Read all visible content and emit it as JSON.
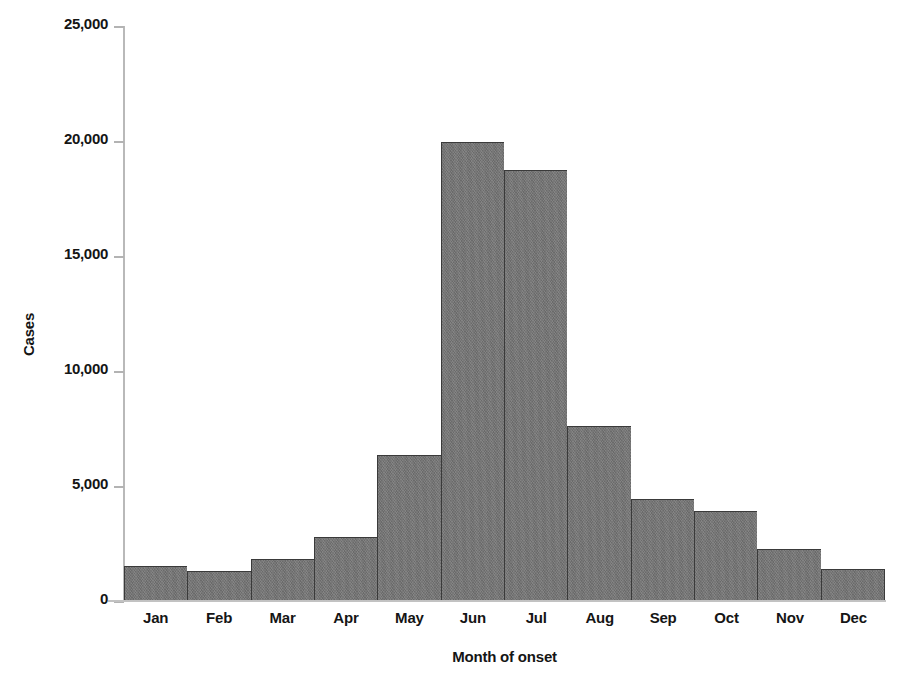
{
  "chart_data": {
    "type": "bar",
    "title": "",
    "xlabel": "Month of onset",
    "ylabel": "Cases",
    "categories": [
      "Jan",
      "Feb",
      "Mar",
      "Apr",
      "May",
      "Jun",
      "Jul",
      "Aug",
      "Sep",
      "Oct",
      "Nov",
      "Dec"
    ],
    "values": [
      1530,
      1310,
      1830,
      2790,
      6370,
      19950,
      18760,
      7590,
      4450,
      3930,
      2270,
      1400
    ],
    "ylim": [
      0,
      25000
    ],
    "ytick_values": [
      0,
      5000,
      10000,
      15000,
      20000,
      25000
    ],
    "ytick_labels": [
      "0",
      "5,000",
      "10,000",
      "15,000",
      "20,000",
      "25,000"
    ],
    "grid": false,
    "legend": null,
    "bar_color": "#767676",
    "bar_edge_color": "#3a3a3a",
    "axis_color": "#bbbbbb",
    "text_color": "#151515",
    "background": "#ffffff"
  }
}
